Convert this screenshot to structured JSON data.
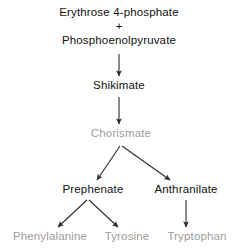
{
  "diagram": {
    "type": "biochemical-pathway-flowchart",
    "colors": {
      "background": "#ffffff",
      "primary_text": "#111111",
      "faded_text": "#9d9d9d",
      "arrow": "#2b2b2b"
    },
    "substrates": {
      "line1": "Erythrose 4-phosphate",
      "plus": "+",
      "line2": "Phosphoenolpyruvate"
    },
    "nodes": {
      "shikimate": "Shikimate",
      "chorismate": "Chorismate",
      "prephenate": "Prephenate",
      "anthranilate": "Anthranilate",
      "phenylalanine": "Phenylalanine",
      "tyrosine": "Tyrosine",
      "tryptophan": "Tryptophan"
    },
    "edges": [
      {
        "from": "substrates",
        "to": "Shikimate"
      },
      {
        "from": "Shikimate",
        "to": "Chorismate"
      },
      {
        "from": "Chorismate",
        "to": "Prephenate"
      },
      {
        "from": "Chorismate",
        "to": "Anthranilate"
      },
      {
        "from": "Prephenate",
        "to": "Phenylalanine"
      },
      {
        "from": "Prephenate",
        "to": "Tyrosine"
      },
      {
        "from": "Anthranilate",
        "to": "Tryptophan"
      }
    ]
  }
}
